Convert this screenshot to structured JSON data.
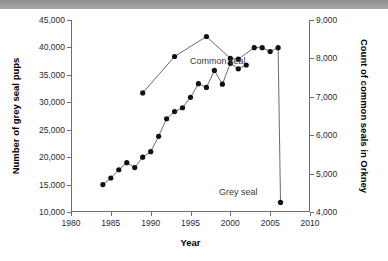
{
  "topbar": {
    "faint_text": "· · ·"
  },
  "chart_data": {
    "type": "line",
    "title": "",
    "subtitle": "",
    "xlabel": "Year",
    "ylabel": "Number of grey seal pups",
    "y2label": "Count of common seals in Orkney",
    "xlim": [
      1980,
      2010
    ],
    "ylim": [
      10000,
      45000
    ],
    "y2lim": [
      4000,
      9000
    ],
    "xticks": [
      "1980",
      "1985",
      "1990",
      "1995",
      "2000",
      "2005",
      "2010"
    ],
    "xtick_values": [
      1980,
      1985,
      1990,
      1995,
      2000,
      2005,
      2010
    ],
    "yticks": [
      "10,000",
      "15,000",
      "20,000",
      "25,000",
      "30,000",
      "35,000",
      "40,000",
      "45,000"
    ],
    "ytick_values": [
      10000,
      15000,
      20000,
      25000,
      30000,
      35000,
      40000,
      45000
    ],
    "y2ticks": [
      "4,000",
      "5,000",
      "6,000",
      "7,000",
      "8,000",
      "9,000"
    ],
    "y2tick_values": [
      4000,
      5000,
      6000,
      7000,
      8000,
      9000
    ],
    "grid": false,
    "legend_position": "inline-annotations",
    "series": [
      {
        "name": "Grey seal",
        "axis": "left",
        "marker": "filled-circle",
        "line": true,
        "x": [
          1984,
          1985,
          1986,
          1987,
          1988,
          1989,
          1990,
          1991,
          1992,
          1993,
          1994,
          1995,
          1996,
          1997,
          1998,
          1999,
          2000,
          2001,
          2002
        ],
        "values": [
          15000,
          16200,
          17700,
          19000,
          18100,
          20000,
          21000,
          23800,
          27000,
          28300,
          29000,
          30900,
          33400,
          32700,
          35800,
          33300,
          37100,
          36100,
          36800
        ]
      },
      {
        "name": "Common seal",
        "axis": "right",
        "marker": "filled-circle",
        "line": true,
        "x": [
          1989,
          1993,
          1997,
          2000,
          2001,
          2003,
          2004,
          2005,
          2006,
          2006.3
        ],
        "values": [
          7100,
          8050,
          8570,
          8000,
          7980,
          8280,
          8280,
          8180,
          8280,
          4250
        ]
      }
    ],
    "annotations": [
      {
        "text": "Common seal",
        "x": 1991.5,
        "y_axis": "right",
        "y": 8600
      },
      {
        "text": "Grey seal",
        "x": 1994.0,
        "y_axis": "left",
        "y": 18200
      }
    ]
  }
}
